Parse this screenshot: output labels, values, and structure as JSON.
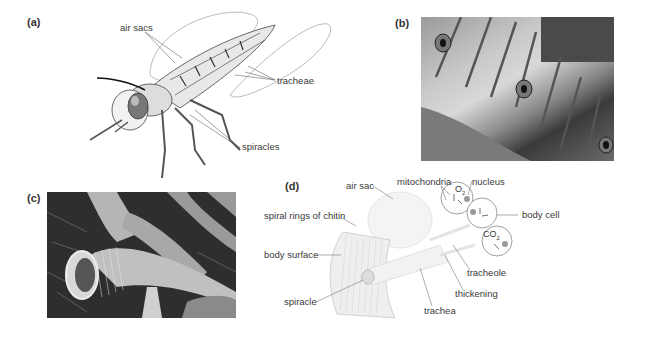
{
  "panels": {
    "a": {
      "label": "(a)",
      "callouts": {
        "air_sacs": "air sacs",
        "tracheae": "tracheae",
        "spiracles": "spiracles"
      }
    },
    "b": {
      "label": "(b)"
    },
    "c": {
      "label": "(c)"
    },
    "d": {
      "label": "(d)",
      "callouts": {
        "air_sac": "air sac",
        "mitochondria": "mitochondria",
        "nucleus": "nucleus",
        "spiral_rings": "spiral rings of chitin",
        "body_surface": "body surface",
        "body_cell": "body cell",
        "spiracle": "spiracle",
        "tracheole": "tracheole",
        "thickening": "thickening",
        "trachea": "trachea"
      },
      "gases": {
        "o2": "O",
        "o2_sub": "2",
        "co2": "CO",
        "co2_sub": "2"
      }
    }
  }
}
